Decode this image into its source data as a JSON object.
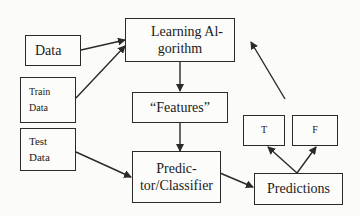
{
  "diagram": {
    "nodes": {
      "data": {
        "label": "Data"
      },
      "train_data": {
        "line1": "Train",
        "line2": "Data"
      },
      "test_data": {
        "line1": "Test",
        "line2": "Data"
      },
      "learning_algorithm": {
        "line1": "Learning Al-",
        "line2": "gorithm"
      },
      "features": {
        "label": "“Features”"
      },
      "predictor": {
        "line1": "Predic-",
        "line2": "tor/Classifier"
      },
      "predictions": {
        "label": "Predictions"
      },
      "true_box": {
        "label": "T"
      },
      "false_box": {
        "label": "F"
      }
    },
    "edges": [
      {
        "from": "Data",
        "to": "Learning Algorithm"
      },
      {
        "from": "Train Data",
        "to": "Learning Algorithm"
      },
      {
        "from": "Learning Algorithm",
        "to": "Features"
      },
      {
        "from": "Features",
        "to": "Predictor/Classifier"
      },
      {
        "from": "Test Data",
        "to": "Predictor/Classifier"
      },
      {
        "from": "Predictor/Classifier",
        "to": "Predictions"
      },
      {
        "from": "Predictions",
        "to": "T"
      },
      {
        "from": "Predictions",
        "to": "F"
      },
      {
        "from": "Predictions area",
        "to": "Learning Algorithm (feedback)"
      }
    ],
    "colors": {
      "line": "#2a2a2a",
      "background": "#fbfbfa"
    }
  }
}
